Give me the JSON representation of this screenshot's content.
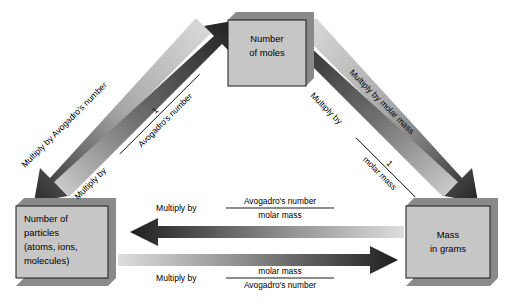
{
  "diagram": {
    "background_color": "#ffffff",
    "box_fill": "#c6c6c6",
    "box_shadow": "#8a8a8a",
    "box_border": "#1a1a1a",
    "arrow_dark": "#1e1e1e",
    "arrow_light": "#d8d8d8",
    "text_color": "#000000"
  },
  "boxes": {
    "moles": {
      "line1": "Number",
      "line2": "of moles"
    },
    "particles": {
      "line1": "Number of",
      "line2": "particles",
      "line3": "(atoms, ions,",
      "line4": "molecules)"
    },
    "mass": {
      "line1": "Mass",
      "line2": "in grams"
    }
  },
  "labels": {
    "left_outer": "Multiply by Avogadro's number",
    "left_inner_prefix": "Multiply by",
    "left_inner_numerator": "1",
    "left_inner_denominator": "Avogadro's number",
    "right_outer": "Multiply by molar mass",
    "right_inner_prefix": "Multiply by",
    "right_inner_numerator": "1",
    "right_inner_denominator": "molar mass",
    "bottom_upper_prefix": "Multiply by",
    "bottom_upper_numerator": "Avogadro's number",
    "bottom_upper_denominator": "molar mass",
    "bottom_lower_prefix": "Multiply by",
    "bottom_lower_numerator": "molar mass",
    "bottom_lower_denominator": "Avogadro's number"
  }
}
